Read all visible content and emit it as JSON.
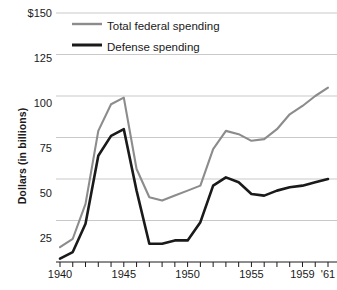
{
  "chart_data": {
    "type": "line",
    "title": "",
    "xlabel": "",
    "ylabel": "Dollars (in billions)",
    "ylim": [
      0,
      150
    ],
    "xlim": [
      1940,
      1961
    ],
    "grid": true,
    "legend_position": "top-left",
    "y_ticks": [
      "$150",
      "125",
      "100",
      "75",
      "50",
      "25"
    ],
    "y_tick_values": [
      150,
      125,
      100,
      75,
      50,
      25
    ],
    "x_ticks": [
      "1940",
      "1945",
      "1950",
      "1955",
      "1959",
      "'61"
    ],
    "x_tick_values": [
      1940,
      1945,
      1950,
      1955,
      1959,
      1961
    ],
    "x": [
      1940,
      1941,
      1942,
      1943,
      1944,
      1945,
      1946,
      1947,
      1948,
      1949,
      1950,
      1951,
      1952,
      1953,
      1954,
      1955,
      1956,
      1957,
      1958,
      1959,
      1960,
      1961
    ],
    "series": [
      {
        "name": "Total federal spending",
        "color": "#8c8c8c",
        "values": [
          9,
          14,
          35,
          79,
          95,
          99,
          56,
          39,
          37,
          40,
          43,
          46,
          68,
          79,
          77,
          73,
          74,
          80,
          89,
          94,
          100,
          105
        ]
      },
      {
        "name": "Defense spending",
        "color": "#1a1a1a",
        "values": [
          2,
          6,
          23,
          64,
          76,
          80,
          43,
          11,
          11,
          13,
          13,
          24,
          46,
          51,
          48,
          41,
          40,
          43,
          45,
          46,
          48,
          50
        ]
      }
    ]
  },
  "legend": {
    "items": [
      {
        "label": "Total federal spending",
        "color": "#8c8c8c"
      },
      {
        "label": "Defense spending",
        "color": "#1a1a1a"
      }
    ]
  },
  "axis": {
    "y_title": "Dollars (in billions)"
  }
}
